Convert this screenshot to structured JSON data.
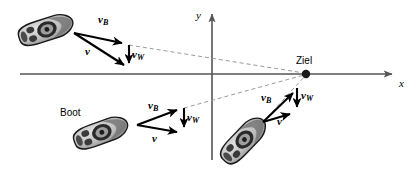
{
  "figure": {
    "background_color": "#ffffff",
    "axis_color": "#555555",
    "vector_color": "#000000",
    "dashed_color": "#999999",
    "boat_fill": "#b8b8b8",
    "boat_stroke": "#1a1a1a"
  },
  "axes": {
    "x_label": "x",
    "y_label": "y",
    "origin": {
      "x": 212,
      "y": 74
    },
    "x_start": {
      "x": 20,
      "y": 74
    },
    "x_end": {
      "x": 398,
      "y": 74
    },
    "y_start": {
      "x": 212,
      "y": 160
    },
    "y_end": {
      "x": 212,
      "y": 8
    }
  },
  "target": {
    "label": "Ziel",
    "x": 306,
    "y": 74,
    "radius": 4.2
  },
  "boat_label": "Boot",
  "vectors": {
    "boat_velocity": "v",
    "boat_velocity_sub": "B",
    "water_velocity": "v",
    "water_velocity_sub": "W",
    "resultant": "v"
  },
  "scenarios": [
    {
      "name": "upper-left-boat",
      "boat": {
        "cx": 45,
        "cy": 30,
        "angle": -18,
        "length": 54,
        "width": 21
      },
      "origin": {
        "x": 74,
        "y": 33
      },
      "vB_tip": {
        "x": 129,
        "y": 45
      },
      "vW_tip": {
        "x": 129,
        "y": 70
      },
      "v_tip": {
        "x": 129,
        "y": 70
      },
      "labels": {
        "vB": {
          "x": 93,
          "y": 18
        },
        "vW": {
          "x": 133,
          "y": 52
        },
        "v": {
          "x": 86,
          "y": 50
        }
      },
      "dashed_to_target": true
    },
    {
      "name": "middle-boat",
      "boat": {
        "cx": 100,
        "cy": 133,
        "angle": -20,
        "length": 54,
        "width": 21
      },
      "origin": {
        "x": 137,
        "y": 125
      },
      "vB_tip": {
        "x": 184,
        "y": 108
      },
      "vW_tip": {
        "x": 184,
        "y": 134
      },
      "v_tip": {
        "x": 184,
        "y": 134
      },
      "labels": {
        "vB": {
          "x": 148,
          "y": 104
        },
        "vW": {
          "x": 188,
          "y": 116
        },
        "v": {
          "x": 152,
          "y": 136
        }
      },
      "boat_name_pos": {
        "x": 76,
        "y": 111
      },
      "dashed_to_target": true
    },
    {
      "name": "right-boat",
      "boat": {
        "cx": 243,
        "cy": 140,
        "angle": -46,
        "length": 54,
        "width": 21
      },
      "origin": {
        "x": 263,
        "y": 122
      },
      "vB_tip": {
        "x": 297,
        "y": 88
      },
      "vW_tip": {
        "x": 297,
        "y": 114
      },
      "v_tip": {
        "x": 297,
        "y": 114
      },
      "labels": {
        "vB": {
          "x": 264,
          "y": 96
        },
        "vW": {
          "x": 301,
          "y": 96
        },
        "v": {
          "x": 278,
          "y": 119
        }
      },
      "dashed_to_target": false
    }
  ]
}
